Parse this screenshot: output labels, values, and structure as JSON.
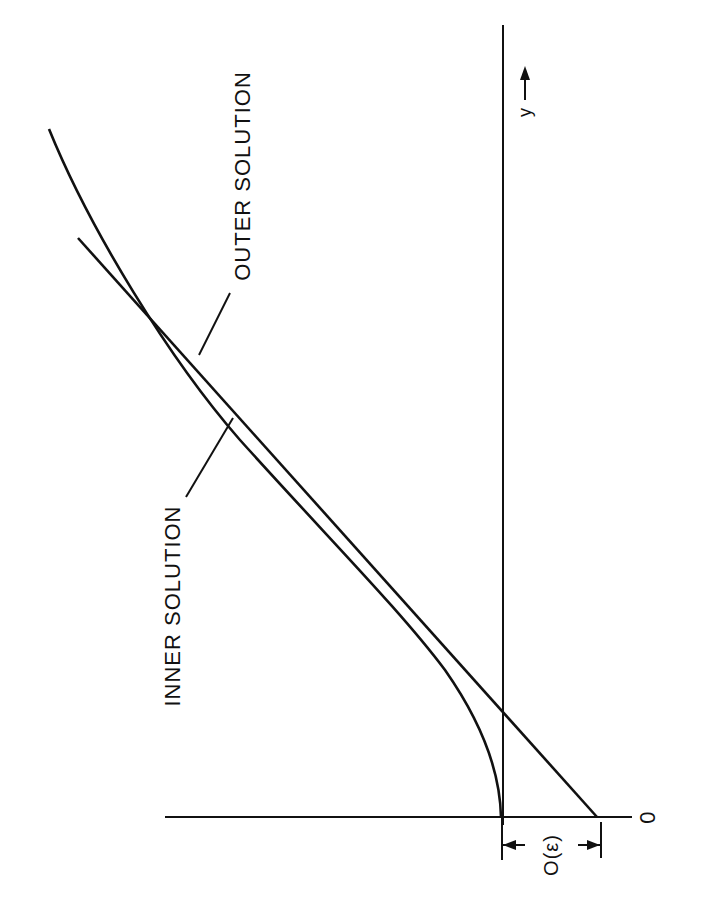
{
  "figure": {
    "labels": {
      "outer_solution": "OUTER SOLUTION",
      "inner_solution": "INNER SOLUTION",
      "axis_variable": "y",
      "origin": "0",
      "offset": "O(ε)"
    },
    "colors": {
      "ink": "#111111",
      "background": "#ffffff"
    },
    "orientation": "rotated 90 degrees counter-clockwise; y axis points up the page"
  }
}
